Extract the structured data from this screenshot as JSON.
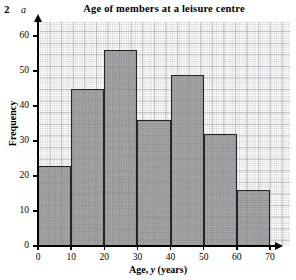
{
  "question": {
    "number": "2",
    "part": "a"
  },
  "chart_data": {
    "type": "bar",
    "title": "Age of members at a leisure centre",
    "xlabel": "Age, y (years)",
    "xlabel_parts": {
      "pre": "Age, ",
      "italic": "y",
      "post": " (years)"
    },
    "ylabel": "Frequency",
    "categories": [
      "0-10",
      "10-20",
      "20-30",
      "30-40",
      "40-50",
      "50-60",
      "60-70"
    ],
    "bin_edges": [
      0,
      10,
      20,
      30,
      40,
      50,
      60,
      70
    ],
    "values": [
      23,
      45,
      56,
      36,
      49,
      32,
      16
    ],
    "xlim": [
      0,
      70
    ],
    "ylim": [
      0,
      64
    ],
    "xticks": [
      0,
      10,
      20,
      30,
      40,
      50,
      60,
      70
    ],
    "yticks": [
      0,
      10,
      20,
      30,
      40,
      50,
      60
    ],
    "xtick_labels": [
      "0",
      "10",
      "20",
      "30",
      "40",
      "50",
      "60",
      "70"
    ],
    "ytick_labels": [
      "0",
      "10",
      "20",
      "30",
      "40",
      "50",
      "60"
    ],
    "grid": true,
    "grid_style": "graph-paper",
    "legend": false,
    "bar_fill_color": "#969698",
    "bar_edge_color": "#242424",
    "axis_color": "#000000",
    "background_color": "#ffffff"
  }
}
